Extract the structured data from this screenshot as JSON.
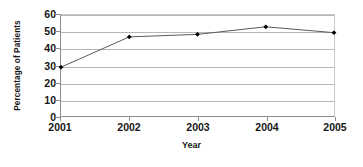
{
  "chart_data": {
    "type": "line",
    "title": "",
    "xlabel": "Year",
    "ylabel": "Percentage of Patients",
    "categories": [
      "2001",
      "2002",
      "2003",
      "2004",
      "2005"
    ],
    "values": [
      29,
      47,
      48.5,
      53,
      49.5
    ],
    "series": [
      {
        "name": "Percentage of Patients",
        "values": [
          29,
          47,
          48.5,
          53,
          49.5
        ]
      }
    ],
    "ylim": [
      0,
      60
    ],
    "yticks": [
      0,
      10,
      20,
      30,
      40,
      50,
      60
    ],
    "ytick_labels": [
      "0",
      "10",
      "20",
      "30",
      "40",
      "50",
      "60"
    ],
    "xtick_labels": [
      "2001",
      "2002",
      "2003",
      "2004",
      "2005"
    ],
    "grid": "horizontal",
    "legend": "none",
    "marker": "diamond",
    "colors": {
      "line": "#5a5a5a",
      "marker": "#000000",
      "grid": "#b5b5b5",
      "axis": "#8c8c8c",
      "background": "#ffffff",
      "text": "#161616"
    }
  }
}
